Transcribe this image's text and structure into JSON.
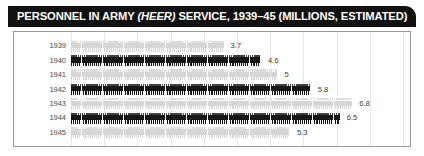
{
  "title": {
    "prefix": "PERSONNEL IN ARMY ",
    "italic": "(HEER)",
    "suffix": " SERVICE, 1939–45 (MILLIONS, ESTIMATED)"
  },
  "colors": {
    "title_bar_background": "#111111",
    "title_text": "#ffffff",
    "panel_border": "#9a9a9a",
    "panel_background": "#ffffff",
    "gridline": "#e7e7e7",
    "bar_dark": "#161616",
    "bar_light": "#d6d6d6",
    "year_label": "#4c4c4c",
    "value_label": "#3a3a3a"
  },
  "chart_data": {
    "type": "bar",
    "orientation": "horizontal",
    "style": "pictogram",
    "title": "PERSONNEL IN ARMY (HEER) SERVICE, 1939–45 (MILLIONS, ESTIMATED)",
    "xlabel": "",
    "ylabel": "",
    "unit": "millions",
    "xlim": [
      0,
      8
    ],
    "grid": true,
    "legend": false,
    "categories": [
      "1939",
      "1940",
      "1941",
      "1942",
      "1943",
      "1944",
      "1945"
    ],
    "values": [
      3.7,
      4.6,
      5,
      5.8,
      6.8,
      6.5,
      5.3
    ],
    "value_labels": [
      "3.7",
      "4.6",
      "5",
      "5.8",
      "6.8",
      "6.5",
      "5.3"
    ],
    "bars": [
      {
        "year": "1939",
        "value": 3.7,
        "label": "3.7",
        "shade": "light"
      },
      {
        "year": "1940",
        "value": 4.6,
        "label": "4.6",
        "shade": "dark"
      },
      {
        "year": "1941",
        "value": 5,
        "label": "5",
        "shade": "light"
      },
      {
        "year": "1942",
        "value": 5.8,
        "label": "5.8",
        "shade": "dark"
      },
      {
        "year": "1943",
        "value": 6.8,
        "label": "6.8",
        "shade": "light"
      },
      {
        "year": "1944",
        "value": 6.5,
        "label": "6.5",
        "shade": "dark"
      },
      {
        "year": "1945",
        "value": 5.3,
        "label": "5.3",
        "shade": "light"
      }
    ]
  }
}
